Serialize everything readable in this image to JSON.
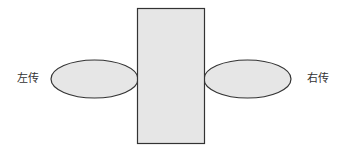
{
  "diagram": {
    "left_label": "左传",
    "right_label": "右传",
    "colors": {
      "fill": "#e6e6e6",
      "stroke": "#333333",
      "text": "#333333",
      "background": "#ffffff"
    }
  }
}
